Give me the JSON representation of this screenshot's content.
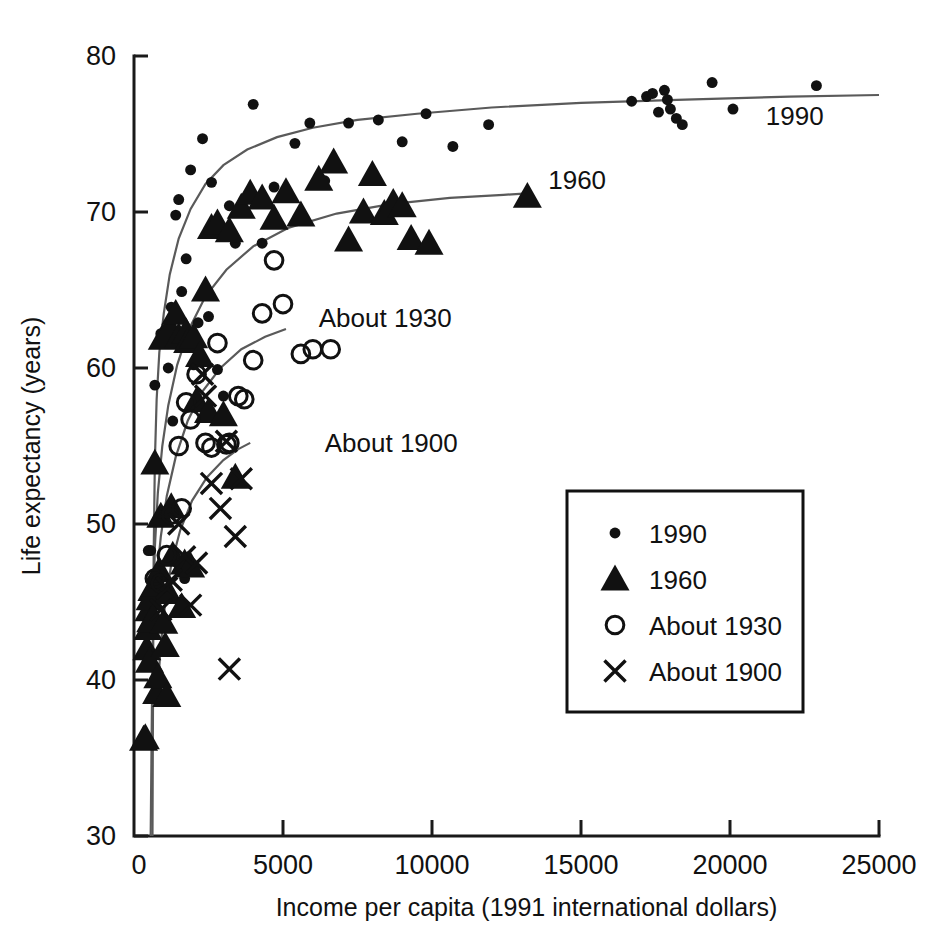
{
  "chart_data": {
    "type": "scatter",
    "title": "",
    "subtitle": "",
    "xlabel": "Income per capita (1991 international dollars)",
    "ylabel": "Life expectancy (years)",
    "xlim": [
      0,
      25000
    ],
    "ylim": [
      30,
      80
    ],
    "xticks": [
      0,
      5000,
      10000,
      15000,
      20000,
      25000
    ],
    "xticklabels": [
      "0",
      "5000",
      "10000",
      "15000",
      "20000",
      "25000"
    ],
    "yticks": [
      30,
      40,
      50,
      60,
      70,
      80
    ],
    "yticklabels": [
      "30",
      "40",
      "50",
      "60",
      "70",
      "80"
    ],
    "grid": false,
    "legend_position": "center-right",
    "marker_color": "#111111",
    "curve_color": "#5a5a5a",
    "legend": [
      {
        "label": "1990",
        "marker": "filled-circle"
      },
      {
        "label": "1960",
        "marker": "filled-triangle"
      },
      {
        "label": "About 1930",
        "marker": "open-circle"
      },
      {
        "label": "About 1900",
        "marker": "cross-x"
      }
    ],
    "curve_annotations": [
      {
        "text": "1990",
        "x": 21200,
        "y": 75.6
      },
      {
        "text": "1960",
        "x": 13900,
        "y": 71.5
      },
      {
        "text": "About 1930",
        "x": 6200,
        "y": 62.6
      },
      {
        "text": "About 1900",
        "x": 6400,
        "y": 54.6
      }
    ],
    "series": [
      {
        "name": "1990",
        "marker": "filled-circle",
        "points": [
          [
            480,
            48.3
          ],
          [
            560,
            48.3
          ],
          [
            700,
            58.9
          ],
          [
            900,
            62.2
          ],
          [
            1000,
            50.6
          ],
          [
            1050,
            50.8
          ],
          [
            1150,
            60.0
          ],
          [
            1250,
            63.9
          ],
          [
            1300,
            56.6
          ],
          [
            1400,
            69.8
          ],
          [
            1500,
            70.8
          ],
          [
            1600,
            64.9
          ],
          [
            1700,
            46.5
          ],
          [
            1750,
            67.0
          ],
          [
            1900,
            72.7
          ],
          [
            2000,
            60.2
          ],
          [
            2150,
            62.9
          ],
          [
            2300,
            74.7
          ],
          [
            2500,
            63.3
          ],
          [
            2600,
            71.9
          ],
          [
            2800,
            59.9
          ],
          [
            3000,
            58.2
          ],
          [
            3200,
            70.4
          ],
          [
            3400,
            68.0
          ],
          [
            3600,
            70.0
          ],
          [
            4000,
            76.9
          ],
          [
            4300,
            68.0
          ],
          [
            4700,
            71.6
          ],
          [
            5400,
            74.4
          ],
          [
            5900,
            75.7
          ],
          [
            6400,
            72.0
          ],
          [
            7200,
            75.7
          ],
          [
            8200,
            75.9
          ],
          [
            9000,
            74.5
          ],
          [
            9800,
            76.3
          ],
          [
            10700,
            74.2
          ],
          [
            11900,
            75.6
          ],
          [
            13200,
            71.0
          ],
          [
            16700,
            77.1
          ],
          [
            17200,
            77.4
          ],
          [
            17400,
            77.6
          ],
          [
            17600,
            76.4
          ],
          [
            17800,
            77.8
          ],
          [
            17900,
            77.2
          ],
          [
            18000,
            76.6
          ],
          [
            18200,
            76.0
          ],
          [
            18400,
            75.6
          ],
          [
            19400,
            78.3
          ],
          [
            20100,
            76.6
          ],
          [
            22900,
            78.1
          ]
        ]
      },
      {
        "name": "1960",
        "marker": "filled-triangle",
        "points": [
          [
            320,
            36.2
          ],
          [
            380,
            36.3
          ],
          [
            430,
            42.0
          ],
          [
            470,
            43.3
          ],
          [
            500,
            44.5
          ],
          [
            520,
            41.2
          ],
          [
            540,
            45.2
          ],
          [
            560,
            43.8
          ],
          [
            600,
            45.8
          ],
          [
            640,
            44.0
          ],
          [
            700,
            53.9
          ],
          [
            720,
            46.1
          ],
          [
            760,
            39.2
          ],
          [
            800,
            40.2
          ],
          [
            850,
            47.0
          ],
          [
            900,
            50.5
          ],
          [
            950,
            61.9
          ],
          [
            1000,
            43.7
          ],
          [
            1050,
            42.2
          ],
          [
            1100,
            39.0
          ],
          [
            1150,
            45.6
          ],
          [
            1200,
            62.6
          ],
          [
            1250,
            51.1
          ],
          [
            1300,
            48.0
          ],
          [
            1400,
            63.5
          ],
          [
            1500,
            62.0
          ],
          [
            1600,
            44.7
          ],
          [
            1700,
            47.5
          ],
          [
            1750,
            62.3
          ],
          [
            1800,
            61.7
          ],
          [
            1900,
            47.3
          ],
          [
            2000,
            62.0
          ],
          [
            2100,
            57.9
          ],
          [
            2200,
            60.8
          ],
          [
            2400,
            65.0
          ],
          [
            2500,
            57.2
          ],
          [
            2600,
            69.0
          ],
          [
            2800,
            69.3
          ],
          [
            3000,
            57.0
          ],
          [
            3200,
            68.8
          ],
          [
            3400,
            53.0
          ],
          [
            3600,
            70.3
          ],
          [
            3900,
            71.2
          ],
          [
            4300,
            70.9
          ],
          [
            4700,
            69.6
          ],
          [
            5100,
            71.3
          ],
          [
            5600,
            69.8
          ],
          [
            6200,
            72.1
          ],
          [
            6700,
            73.2
          ],
          [
            7200,
            68.2
          ],
          [
            7700,
            70.0
          ],
          [
            8000,
            72.4
          ],
          [
            8400,
            69.9
          ],
          [
            8700,
            70.6
          ],
          [
            9000,
            70.4
          ],
          [
            9300,
            68.3
          ],
          [
            9900,
            68.0
          ],
          [
            13200,
            71.0
          ]
        ]
      },
      {
        "name": "About 1930",
        "marker": "open-circle",
        "points": [
          [
            700,
            46.5
          ],
          [
            900,
            46.2
          ],
          [
            1100,
            48.0
          ],
          [
            1250,
            50.6
          ],
          [
            1500,
            55.0
          ],
          [
            1600,
            51.0
          ],
          [
            1750,
            57.8
          ],
          [
            1900,
            56.7
          ],
          [
            2100,
            59.6
          ],
          [
            2400,
            55.2
          ],
          [
            2600,
            54.9
          ],
          [
            2800,
            61.6
          ],
          [
            3100,
            55.1
          ],
          [
            3200,
            55.2
          ],
          [
            3500,
            58.2
          ],
          [
            3700,
            58.0
          ],
          [
            4000,
            60.5
          ],
          [
            4300,
            63.5
          ],
          [
            4700,
            66.9
          ],
          [
            5000,
            64.1
          ],
          [
            5600,
            60.9
          ],
          [
            6000,
            61.2
          ],
          [
            6600,
            61.2
          ]
        ]
      },
      {
        "name": "About 1900",
        "marker": "cross-x",
        "points": [
          [
            900,
            44.5
          ],
          [
            1100,
            45.9
          ],
          [
            1250,
            46.4
          ],
          [
            1500,
            50.0
          ],
          [
            1700,
            47.9
          ],
          [
            1900,
            44.8
          ],
          [
            2100,
            47.5
          ],
          [
            2300,
            59.6
          ],
          [
            2400,
            58.2
          ],
          [
            2600,
            52.6
          ],
          [
            2900,
            51.0
          ],
          [
            3100,
            55.3
          ],
          [
            3200,
            40.7
          ],
          [
            3400,
            49.2
          ],
          [
            3600,
            52.9
          ]
        ]
      }
    ],
    "fitted_curves": [
      {
        "name": "1990",
        "points": [
          [
            620,
            30.0
          ],
          [
            640,
            40.0
          ],
          [
            660,
            48.0
          ],
          [
            700,
            54.0
          ],
          [
            760,
            58.0
          ],
          [
            850,
            61.0
          ],
          [
            1000,
            63.5
          ],
          [
            1200,
            66.0
          ],
          [
            1500,
            68.3
          ],
          [
            1900,
            70.2
          ],
          [
            2400,
            71.8
          ],
          [
            3000,
            73.0
          ],
          [
            3800,
            74.0
          ],
          [
            4800,
            74.8
          ],
          [
            6000,
            75.4
          ],
          [
            7500,
            75.9
          ],
          [
            9500,
            76.3
          ],
          [
            12000,
            76.7
          ],
          [
            15000,
            77.0
          ],
          [
            18500,
            77.2
          ],
          [
            22000,
            77.4
          ],
          [
            25000,
            77.5
          ]
        ]
      },
      {
        "name": "1960",
        "points": [
          [
            560,
            30.0
          ],
          [
            600,
            38.0
          ],
          [
            640,
            44.0
          ],
          [
            700,
            48.5
          ],
          [
            800,
            52.0
          ],
          [
            950,
            55.0
          ],
          [
            1150,
            57.6
          ],
          [
            1450,
            60.2
          ],
          [
            1850,
            62.5
          ],
          [
            2400,
            64.6
          ],
          [
            3100,
            66.3
          ],
          [
            4000,
            67.8
          ],
          [
            5200,
            69.0
          ],
          [
            6800,
            69.9
          ],
          [
            8600,
            70.5
          ],
          [
            10600,
            70.9
          ],
          [
            12400,
            71.1
          ],
          [
            13200,
            71.2
          ]
        ]
      },
      {
        "name": "About 1930",
        "points": [
          [
            680,
            44.0
          ],
          [
            760,
            46.5
          ],
          [
            900,
            49.2
          ],
          [
            1100,
            51.8
          ],
          [
            1400,
            54.3
          ],
          [
            1800,
            56.6
          ],
          [
            2300,
            58.5
          ],
          [
            2900,
            60.0
          ],
          [
            3600,
            61.2
          ],
          [
            4400,
            62.0
          ],
          [
            5100,
            62.5
          ]
        ]
      },
      {
        "name": "About 1900",
        "points": [
          [
            820,
            40.0
          ],
          [
            900,
            42.3
          ],
          [
            1050,
            45.0
          ],
          [
            1250,
            47.4
          ],
          [
            1550,
            49.6
          ],
          [
            1950,
            51.5
          ],
          [
            2450,
            53.0
          ],
          [
            3000,
            54.1
          ],
          [
            3500,
            54.8
          ],
          [
            3900,
            55.2
          ]
        ]
      }
    ]
  }
}
